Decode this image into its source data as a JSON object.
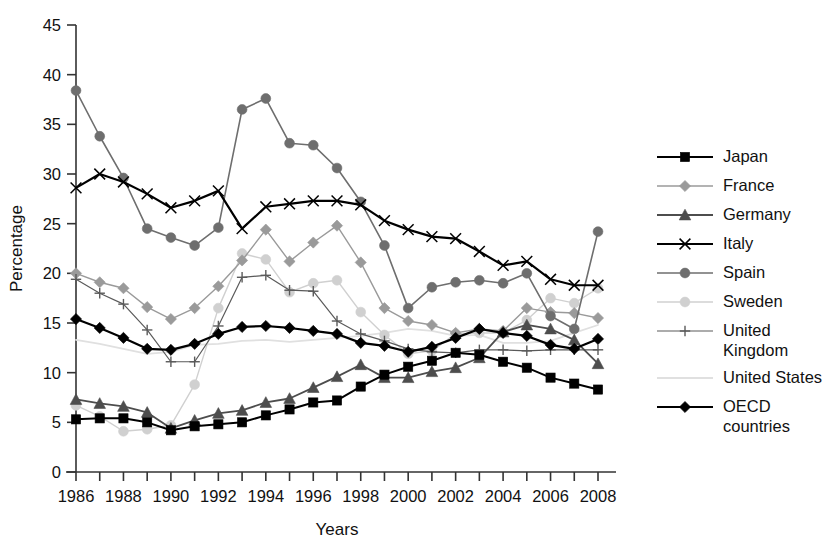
{
  "chart_data": {
    "type": "line",
    "title": "",
    "xlabel": "Years",
    "ylabel": "Percentage",
    "xlim": [
      1986,
      2008
    ],
    "ylim": [
      0,
      45
    ],
    "ytick_step": 5,
    "xtick_step": 1,
    "xtick_label_step": 2,
    "grid": false,
    "legend_position": "right",
    "x": [
      1986,
      1987,
      1988,
      1989,
      1990,
      1991,
      1992,
      1993,
      1994,
      1995,
      1996,
      1997,
      1998,
      1999,
      2000,
      2001,
      2002,
      2003,
      2004,
      2005,
      2006,
      2007,
      2008
    ],
    "xtick_labels": [
      "1986",
      "",
      "1988",
      "",
      "1990",
      "",
      "1992",
      "",
      "1994",
      "",
      "1996",
      "",
      "1998",
      "",
      "2000",
      "",
      "2002",
      "",
      "2004",
      "",
      "2006",
      "",
      "2008"
    ],
    "ytick_labels": [
      "0",
      "5",
      "10",
      "15",
      "20",
      "25",
      "30",
      "35",
      "40",
      "45"
    ],
    "series": [
      {
        "name": "Japan",
        "marker": "square",
        "color": "#000000",
        "line_width": 2.0,
        "values": [
          5.3,
          5.4,
          5.4,
          5.0,
          4.2,
          4.6,
          4.8,
          5.0,
          5.7,
          6.3,
          7.0,
          7.2,
          8.6,
          9.8,
          10.6,
          11.2,
          12.0,
          11.8,
          11.1,
          10.5,
          9.5,
          8.9,
          8.3
        ]
      },
      {
        "name": "France",
        "marker": "diamond",
        "color": "#9a9a9a",
        "line_width": 1.4,
        "values": [
          20.0,
          19.1,
          18.5,
          16.6,
          15.4,
          16.5,
          18.7,
          21.3,
          24.4,
          21.2,
          23.1,
          24.8,
          21.1,
          16.5,
          15.2,
          14.8,
          14.0,
          14.4,
          14.2,
          16.5,
          16.1,
          16.0,
          15.5
        ]
      },
      {
        "name": "Germany",
        "marker": "triangle",
        "color": "#4d4d4d",
        "line_width": 1.8,
        "values": [
          7.3,
          6.9,
          6.6,
          6.0,
          4.4,
          5.2,
          5.9,
          6.2,
          7.0,
          7.4,
          8.5,
          9.6,
          10.8,
          9.5,
          9.5,
          10.1,
          10.5,
          11.5,
          14.1,
          14.8,
          14.4,
          13.3,
          10.9
        ]
      },
      {
        "name": "Italy",
        "marker": "x",
        "color": "#000000",
        "line_width": 2.2,
        "values": [
          28.6,
          30.0,
          29.2,
          28.0,
          26.6,
          27.3,
          28.3,
          24.5,
          26.7,
          27.0,
          27.3,
          27.3,
          26.9,
          25.3,
          24.4,
          23.7,
          23.5,
          22.2,
          20.8,
          21.2,
          19.4,
          18.8,
          18.8
        ]
      },
      {
        "name": "Spain",
        "marker": "circle",
        "color": "#6e6e6e",
        "line_width": 1.6,
        "values": [
          38.4,
          33.8,
          29.6,
          24.5,
          23.6,
          22.8,
          24.6,
          36.5,
          37.6,
          33.1,
          32.9,
          30.6,
          27.2,
          22.8,
          16.5,
          18.6,
          19.1,
          19.3,
          19.0,
          20.0,
          15.7,
          14.4,
          24.2
        ]
      },
      {
        "name": "Sweden",
        "marker": "circle",
        "color": "#d0d0d0",
        "line_width": 1.4,
        "values": [
          6.7,
          5.6,
          4.1,
          4.3,
          4.7,
          8.8,
          16.5,
          22.0,
          21.4,
          18.1,
          19.0,
          19.3,
          16.1,
          13.8,
          11.9,
          12.2,
          13.9,
          14.0,
          14.0,
          15.3,
          17.5,
          17.0,
          18.5
        ]
      },
      {
        "name": "United\nKingdom",
        "marker": "plus",
        "color": "#5a5a5a",
        "line_width": 1.2,
        "values": [
          19.4,
          18.0,
          16.9,
          14.3,
          11.1,
          11.1,
          14.7,
          19.6,
          19.8,
          18.3,
          18.2,
          15.2,
          13.9,
          13.2,
          12.4,
          12.1,
          12.0,
          12.3,
          12.3,
          12.2,
          12.3,
          12.3,
          12.3
        ]
      },
      {
        "name": "United States",
        "marker": "none",
        "color": "#e0e0e0",
        "line_width": 1.8,
        "values": [
          13.3,
          12.9,
          12.4,
          11.9,
          12.1,
          12.8,
          12.9,
          13.2,
          13.3,
          13.1,
          13.3,
          13.5,
          13.7,
          14.0,
          14.4,
          14.2,
          13.7,
          13.8,
          13.0,
          13.0,
          13.2,
          14.0,
          14.8
        ]
      },
      {
        "name": "OECD\ncountries",
        "marker": "diamond",
        "color": "#000000",
        "line_width": 2.2,
        "values": [
          15.4,
          14.5,
          13.5,
          12.4,
          12.3,
          12.9,
          13.9,
          14.6,
          14.7,
          14.5,
          14.2,
          13.9,
          13.0,
          12.7,
          12.1,
          12.6,
          13.5,
          14.4,
          14.0,
          13.7,
          12.8,
          12.4,
          13.4
        ]
      }
    ]
  },
  "legend": {
    "items": [
      {
        "label": "Japan"
      },
      {
        "label": "France"
      },
      {
        "label": "Germany"
      },
      {
        "label": "Italy"
      },
      {
        "label": "Spain"
      },
      {
        "label": "Sweden"
      },
      {
        "label": "United\nKingdom"
      },
      {
        "label": "United States"
      },
      {
        "label": "OECD\ncountries"
      }
    ]
  }
}
